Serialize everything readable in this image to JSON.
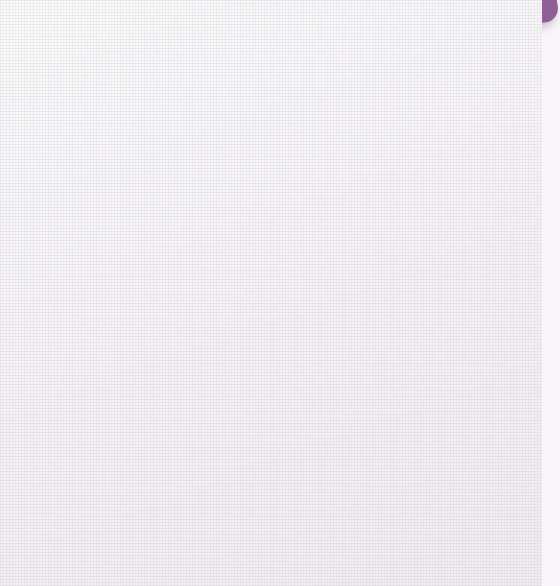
{
  "chart_data": {
    "type": "pie",
    "title": "Monthly Expenses",
    "categories": [
      "Meals",
      "Rent",
      "Savings",
      "Entertainment",
      "Gasoline"
    ],
    "values": [
      17,
      25,
      25,
      12,
      21
    ],
    "value_labels": [
      "17%",
      "25%",
      "25%",
      "12%",
      "21%"
    ],
    "unit": "%",
    "start_angle_deg": 0,
    "direction": "clockwise",
    "legend": "none",
    "grid": false,
    "slices": [
      {
        "label": "Meals",
        "value": 17,
        "value_label": "17%",
        "color": "#9b7fa8",
        "text_color": "#111013"
      },
      {
        "label": "Rent",
        "value": 25,
        "value_label": "25%",
        "color": "#c5b6ce",
        "text_color": "#111013"
      },
      {
        "label": "Savings",
        "value": 25,
        "value_label": "25%",
        "color": "#fefefe",
        "text_color": "#111013"
      },
      {
        "label": "Entertainment",
        "value": 12,
        "value_label": "12%",
        "color": "#5a2a62",
        "text_color": "#ffffff"
      },
      {
        "label": "Gasoline",
        "value": 21,
        "value_label": "21%",
        "color": "#8a5f91",
        "text_color": "#111013"
      }
    ]
  },
  "colors": {
    "title": "#4a2b5c",
    "background": "#f7f5f7",
    "outline": "#5d4a63",
    "corner_fragment": "#8f5f96"
  }
}
